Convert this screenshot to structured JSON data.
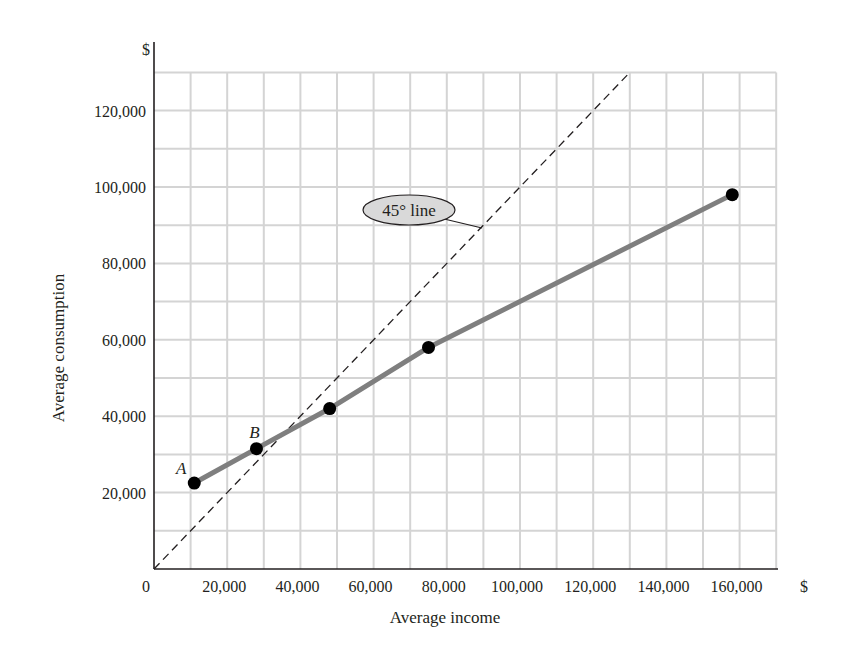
{
  "chart_data": {
    "type": "line",
    "title": "",
    "xlabel": "Average income",
    "ylabel": "Average consumption",
    "x_unit_label": "$",
    "y_unit_label": "$",
    "xlim": [
      0,
      170000
    ],
    "ylim": [
      0,
      130000
    ],
    "grid": true,
    "grid_step": 10000,
    "x_ticks": [
      0,
      20000,
      40000,
      60000,
      80000,
      100000,
      120000,
      140000,
      160000
    ],
    "x_tick_labels": [
      "0",
      "20,000",
      "40,000",
      "60,000",
      "80,000",
      "100,000",
      "120,000",
      "140,000",
      "160,000"
    ],
    "y_ticks": [
      20000,
      40000,
      60000,
      80000,
      100000,
      120000
    ],
    "y_tick_labels": [
      "20,000",
      "40,000",
      "60,000",
      "80,000",
      "100,000",
      "120,000"
    ],
    "series": [
      {
        "name": "Consumption function",
        "style": "solid",
        "color": "#7f7f7f",
        "markers": true,
        "marker_color": "#000000",
        "x": [
          11000,
          28000,
          48000,
          75000,
          158000
        ],
        "y": [
          22500,
          31500,
          42000,
          58000,
          98000
        ],
        "point_labels": [
          "A",
          "B",
          "",
          "",
          ""
        ]
      },
      {
        "name": "45° line",
        "style": "dashed",
        "color": "#231f20",
        "markers": false,
        "x": [
          0,
          130000
        ],
        "y": [
          0,
          130000
        ]
      }
    ],
    "annotations": [
      {
        "text": "45° line",
        "shape": "ellipse",
        "fill": "#d9d9d9",
        "points_to": [
          88000,
          88000
        ]
      }
    ]
  }
}
